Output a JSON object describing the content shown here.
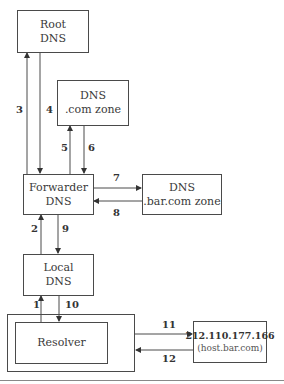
{
  "nodes": {
    "root": {
      "line1": "Root",
      "line2": "DNS"
    },
    "com_zone": {
      "line1": "DNS",
      "line2": ".com zone"
    },
    "forwarder": {
      "line1": "Forwarder",
      "line2": "DNS"
    },
    "barcom_zone": {
      "line1": "DNS",
      "line2": ".bar.com zone"
    },
    "local": {
      "line1": "Local",
      "line2": "DNS"
    },
    "resolver": {
      "label": "Resolver"
    },
    "host": {
      "ip": "212.110.177.166",
      "name": "(host.bar.com)"
    }
  },
  "steps": [
    "1",
    "2",
    "3",
    "4",
    "5",
    "6",
    "7",
    "8",
    "9",
    "10",
    "11",
    "12"
  ],
  "colors": {
    "line": "#4a4a4a",
    "text": "#3a3a3a"
  }
}
